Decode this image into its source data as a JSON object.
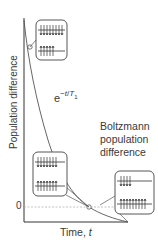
{
  "figure": {
    "y_axis_label": "Population difference",
    "x_axis_label_text": "Time, ",
    "x_axis_label_var": "t",
    "zero_tick": "0",
    "equation": {
      "base": "e",
      "exponent_prefix": "−",
      "exponent_var": "t",
      "exponent_sep": "/",
      "exponent_T": "T",
      "exponent_sub": "1"
    },
    "annotation": "Boltzmann population difference",
    "colors": {
      "axis": "#333333",
      "curve": "#555555",
      "dashed": "#999999",
      "panel_border": "#444444",
      "text": "#3a3a3a"
    },
    "panels": [
      {
        "id": "initial",
        "upper_level_spins": 8,
        "lower_level_spins": 5
      },
      {
        "id": "intermediate",
        "upper_level_spins": 7,
        "lower_level_spins": 7
      },
      {
        "id": "equilibrium",
        "upper_level_spins": 4,
        "lower_level_spins": 9
      }
    ]
  }
}
